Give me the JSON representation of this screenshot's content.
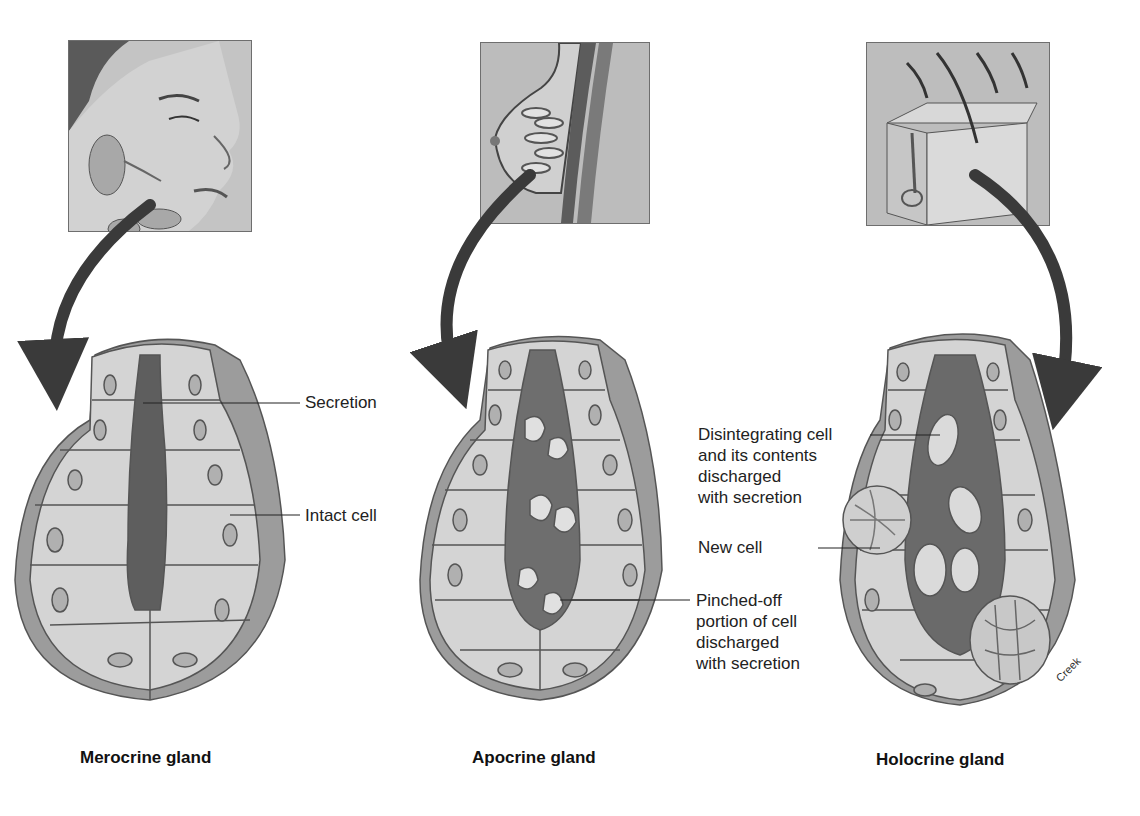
{
  "figure": {
    "panels": [
      {
        "id": "merocrine",
        "caption": "Merocrine gland",
        "thumbnail": "face-salivary-glands",
        "labels": [
          "Secretion",
          "Intact cell"
        ]
      },
      {
        "id": "apocrine",
        "caption": "Apocrine gland",
        "thumbnail": "breast-mammary-gland",
        "labels": [
          "Pinched-off",
          "portion of cell",
          "discharged",
          "with secretion"
        ]
      },
      {
        "id": "holocrine",
        "caption": "Holocrine gland",
        "thumbnail": "skin-sebaceous-gland",
        "labels": {
          "disintegrating": [
            "Disintegrating cell",
            "and its contents",
            "discharged",
            "with secretion"
          ],
          "new_cell": "New cell"
        }
      }
    ],
    "credit": "Creek"
  },
  "colors": {
    "cell_fill": "#d4d4d4",
    "cell_stroke": "#555555",
    "lumen": "#5e5e5e",
    "arrow": "#3a3a3a",
    "thumb_bg": "#bdbdbd"
  }
}
